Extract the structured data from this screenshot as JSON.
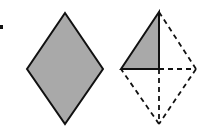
{
  "diagram": {
    "colors": {
      "fill": "#a9a9a9",
      "stroke": "#111111",
      "background": "#ffffff"
    },
    "bullet": {
      "x": 0,
      "y": 25,
      "w": 3,
      "h": 4
    },
    "left_rhombus": {
      "top": [
        65,
        13
      ],
      "right": [
        103,
        69
      ],
      "bottom": [
        65,
        124
      ],
      "left": [
        27,
        69
      ],
      "filled": true
    },
    "right_figure": {
      "top": [
        159,
        12
      ],
      "right": [
        196,
        69
      ],
      "bottom": [
        159,
        124
      ],
      "left": [
        121,
        69
      ],
      "center": [
        159,
        69
      ],
      "shaded_triangle": "top-left",
      "solid_edges": [
        "left-top",
        "top-center",
        "center-left"
      ],
      "dashed_edges": [
        "top-right",
        "right-bottom",
        "bottom-left",
        "center-right",
        "center-bottom"
      ]
    }
  }
}
